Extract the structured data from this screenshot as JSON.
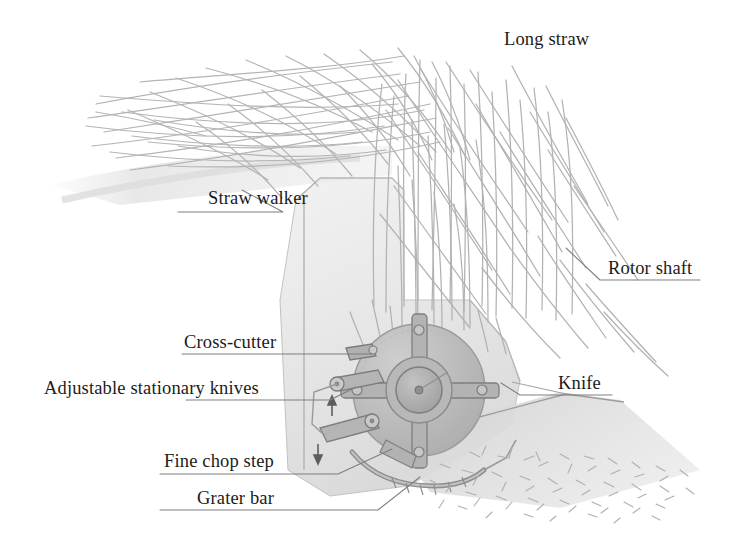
{
  "figure": {
    "background_color": "#ffffff",
    "text_color": "#1b1b1b",
    "line_color": "#8d8d8d",
    "straw_color": "#b6b6b6",
    "housing_color": "#dcdcdc",
    "rotor_color": "#b0b0b0",
    "rotor_dark_color": "#8a8a8a",
    "chaff_color": "#c0c0c0"
  },
  "labels": {
    "long_straw": "Long straw",
    "straw_walker": "Straw walker",
    "rotor_shaft": "Rotor shaft",
    "cross_cutter": "Cross-cutter",
    "adjustable_stationary_knives": "Adjustable stationary knives",
    "knife": "Knife",
    "fine_chop_step": "Fine chop step",
    "grater_bar": "Grater bar"
  },
  "label_positions": {
    "long_straw": {
      "x": 504,
      "y": 30
    },
    "straw_walker": {
      "x": 208,
      "y": 189
    },
    "rotor_shaft": {
      "x": 608,
      "y": 259
    },
    "cross_cutter": {
      "x": 184,
      "y": 333
    },
    "adjustable_stationary_knives": {
      "x": 44,
      "y": 379
    },
    "knife": {
      "x": 558,
      "y": 374
    },
    "fine_chop_step": {
      "x": 164,
      "y": 452
    },
    "grater_bar": {
      "x": 197,
      "y": 489
    }
  },
  "leader_lines": [
    {
      "name": "straw-walker-leader",
      "points": "178,212 283,212 242,190"
    },
    {
      "name": "rotor-shaft-leader",
      "points": "700,280 600,280 566,248"
    },
    {
      "name": "cross-cutter-leader",
      "points": "182,354 372,354"
    },
    {
      "name": "adjustable-knives-leader",
      "points": "186,400 330,400 356,387"
    },
    {
      "name": "knife-leader",
      "points": "612,395 520,395 501,383"
    },
    {
      "name": "fine-chop-step-leader",
      "points": "160,474 338,474 392,449"
    },
    {
      "name": "grater-bar-leader",
      "points": "160,510 378,510 420,477"
    }
  ],
  "components": {
    "rotor": {
      "center": {
        "x": 419,
        "y": 390
      },
      "housing_radius": 66,
      "hub_radius": 23,
      "arm_count": 4,
      "arm_angles_deg": [
        15,
        105,
        195,
        285
      ]
    },
    "stationary_knives_count": 2,
    "adjustment_arrows": 2
  }
}
